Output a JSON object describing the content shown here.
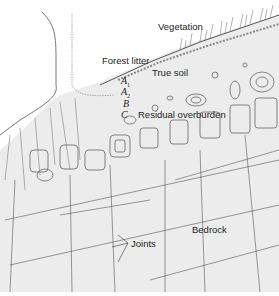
{
  "diagram": {
    "type": "soil profile cross-section",
    "labels": {
      "vegetation": "Vegetation",
      "forest_litter": "Forest litter",
      "true_soil": "True soil",
      "residual_overburden": "Residual overburden",
      "bedrock": "Bedrock",
      "joints": "Joints"
    },
    "horizons": [
      {
        "letter": "A",
        "sub": "1"
      },
      {
        "letter": "A",
        "sub": "2"
      },
      {
        "letter": "B",
        "sub": ""
      },
      {
        "letter": "C",
        "sub": ""
      }
    ],
    "colors": {
      "sky": "#ffffff",
      "ground": "#ececec",
      "line": "#444444"
    }
  }
}
